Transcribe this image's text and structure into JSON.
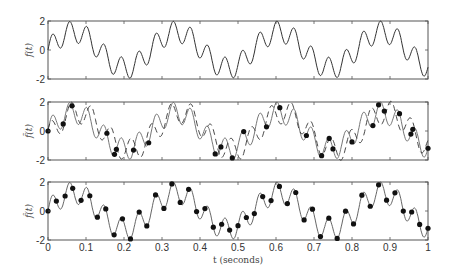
{
  "chart_data": [
    {
      "type": "line",
      "panel": "top",
      "ylabel": "f(t)",
      "ylim": [
        -2,
        2
      ],
      "yticks": [
        "2",
        "0",
        "-2"
      ],
      "xlim": [
        0,
        1
      ],
      "series": [
        {
          "name": "f(t) original signal",
          "style": "solid",
          "model": {
            "a1": 1.25,
            "f1": 3.7,
            "a2": 0.75,
            "f2": 22
          }
        }
      ]
    },
    {
      "type": "line",
      "panel": "middle",
      "ylabel": "f̃(t)",
      "ylim": [
        -2,
        2
      ],
      "yticks": [
        "2",
        "0",
        "-2"
      ],
      "xlim": [
        0,
        1
      ],
      "series": [
        {
          "name": "original signal",
          "style": "solid-gray"
        },
        {
          "name": "reconstruction from irregular samples",
          "style": "dashed"
        },
        {
          "name": "samples",
          "style": "markers",
          "t": [
            0.0,
            0.04,
            0.063,
            0.155,
            0.175,
            0.18,
            0.225,
            0.265,
            0.44,
            0.455,
            0.485,
            0.515,
            0.575,
            0.61,
            0.68,
            0.72,
            0.74,
            0.75,
            0.8,
            0.855,
            0.87,
            0.885,
            0.925,
            0.955,
            0.96,
            1.0
          ]
        }
      ]
    },
    {
      "type": "scatter",
      "panel": "bottom",
      "ylabel": "f̂(t)",
      "ylim": [
        -2,
        2
      ],
      "yticks": [
        "2",
        "0",
        "-2"
      ],
      "xlim": [
        0,
        1
      ],
      "xticks": [
        "0",
        "0.1",
        "0.2",
        "0.3",
        "0.4",
        "0.5",
        "0.6",
        "0.7",
        "0.8",
        "0.9",
        "1"
      ],
      "xlabel": "t (seconds)",
      "series": [
        {
          "name": "reconstruction",
          "style": "solid"
        },
        {
          "name": "samples",
          "style": "markers",
          "t": [
            0.0,
            0.022,
            0.045,
            0.065,
            0.087,
            0.11,
            0.13,
            0.152,
            0.174,
            0.196,
            0.217,
            0.24,
            0.26,
            0.283,
            0.305,
            0.326,
            0.348,
            0.37,
            0.391,
            0.413,
            0.435,
            0.457,
            0.478,
            0.5,
            0.522,
            0.543,
            0.565,
            0.587,
            0.609,
            0.63,
            0.652,
            0.674,
            0.696,
            0.717,
            0.739,
            0.761,
            0.783,
            0.804,
            0.826,
            0.848,
            0.87,
            0.891,
            0.913,
            0.935,
            0.957,
            0.978,
            1.0
          ]
        }
      ]
    }
  ],
  "axes": {
    "xlabel": "t (seconds)",
    "xticks": [
      "0",
      "0.1",
      "0.2",
      "0.3",
      "0.4",
      "0.5",
      "0.6",
      "0.7",
      "0.8",
      "0.9",
      "1"
    ],
    "yticks": [
      "2",
      "0",
      "-2"
    ],
    "panel1_ylabel": "f(t)",
    "panel2_ylabel": "f̃(t)",
    "panel3_ylabel": "f̂(t)"
  }
}
